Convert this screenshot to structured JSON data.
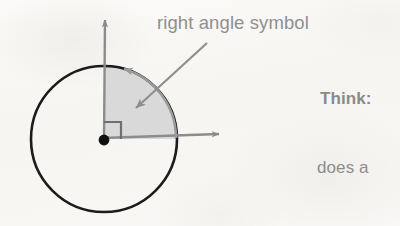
{
  "page": {
    "background_color": "#f8f7f5",
    "width": 400,
    "height": 226
  },
  "labels": {
    "callout": "right angle symbol",
    "think": "Think:",
    "question_fragment": "does a"
  },
  "colors": {
    "circle_stroke": "#1b1b1b",
    "axis_stroke": "#8c8c8c",
    "sector_fill": "#d9d9d9",
    "sector_stroke": "#9a9a9a",
    "pointer_stroke": "#8e8e8e",
    "text": "#8c8c8c",
    "center_dot": "#111111"
  },
  "diagram": {
    "center": {
      "x": 104,
      "y": 139
    },
    "circle_radius": 73,
    "circle_label": "circle",
    "sector": {
      "label": "shaded quarter sector",
      "start_angle_deg": 0,
      "end_angle_deg": 90,
      "radius": 73
    },
    "right_angle_square": {
      "label": "right angle symbol square",
      "size": 17
    },
    "center_dot_radius": 5,
    "axes": [
      {
        "name": "vertical-axis-arrow",
        "from": {
          "x": 104,
          "y": 139
        },
        "to": {
          "x": 105,
          "y": 15
        },
        "direction": "up"
      },
      {
        "name": "horizontal-axis-arrow",
        "from": {
          "x": 104,
          "y": 139
        },
        "to": {
          "x": 226,
          "y": 134
        },
        "direction": "right"
      }
    ],
    "arc_arrow": {
      "name": "rotation-arc-arrow",
      "direction": "counterclockwise",
      "tip": {
        "x": 111,
        "y": 66
      }
    },
    "pointer_arrow": {
      "name": "callout-pointer-arrow",
      "from": {
        "x": 207,
        "y": 43
      },
      "to": {
        "x": 131,
        "y": 113
      }
    }
  }
}
